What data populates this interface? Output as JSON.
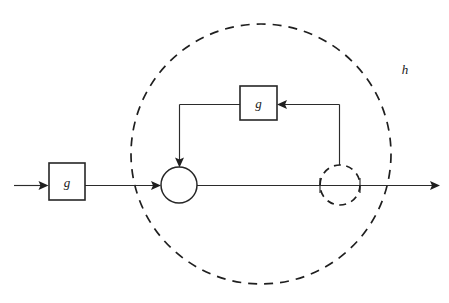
{
  "figure": {
    "type": "block-diagram",
    "title": "",
    "background_color": "#ffffff",
    "line_color": "#2b2b2b",
    "dash_color": "#1f1f1f",
    "width": 449,
    "height": 303
  },
  "labels": {
    "outer_boundary": "h",
    "input_block": "g",
    "feedback_block": "g"
  },
  "nodes": [
    {
      "id": "input-block",
      "kind": "rectangle-block",
      "label": "g",
      "x": 49,
      "y": 163,
      "width": 36,
      "height": 37
    },
    {
      "id": "feedback-block",
      "kind": "rectangle-block",
      "label": "g",
      "x": 240,
      "y": 86,
      "width": 37,
      "height": 34
    },
    {
      "id": "summing-junction",
      "kind": "solid-circle",
      "label": "",
      "cx": 179,
      "cy": 185,
      "r": 18
    },
    {
      "id": "output-node",
      "kind": "dashed-circle",
      "label": "",
      "cx": 340,
      "cy": 185,
      "r": 20
    },
    {
      "id": "outer-boundary",
      "kind": "dashed-circle",
      "label": "h",
      "cx": 261,
      "cy": 154,
      "r": 130
    }
  ],
  "edges": [
    {
      "id": "edge-input",
      "from": "external-input",
      "to": "input-block",
      "arrow": true
    },
    {
      "id": "edge-block-to-junction",
      "from": "input-block",
      "to": "summing-junction",
      "arrow": true
    },
    {
      "id": "edge-junction-to-output",
      "from": "summing-junction",
      "to": "output-node",
      "arrow": false
    },
    {
      "id": "edge-output-to-external",
      "from": "output-node",
      "to": "external-output",
      "arrow": true
    },
    {
      "id": "edge-output-to-feedback-block",
      "from": "output-node",
      "to": "feedback-block",
      "arrow": true
    },
    {
      "id": "edge-feedback-block-to-junction",
      "from": "feedback-block",
      "to": "summing-junction",
      "arrow": true
    }
  ]
}
